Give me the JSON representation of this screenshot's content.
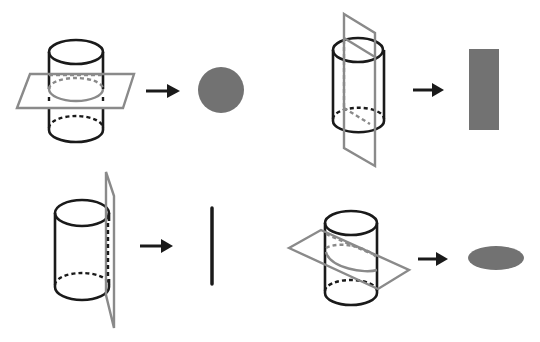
{
  "diagram": {
    "colors": {
      "cylinder_outline": "#1a1a1a",
      "plane": "#8a8a8a",
      "section_fill": "#727272",
      "background": "#ffffff"
    },
    "panels": [
      {
        "id": "horizontal-cut",
        "plane": "horizontal, parallel to base",
        "arrow": "right-arrow",
        "result_shape": "circle"
      },
      {
        "id": "vertical-axial-cut",
        "plane": "vertical, through axis",
        "arrow": "right-arrow",
        "result_shape": "rectangle"
      },
      {
        "id": "tangent-cut",
        "plane": "vertical, tangent to side",
        "arrow": "right-arrow",
        "result_shape": "line-segment"
      },
      {
        "id": "oblique-cut",
        "plane": "oblique, not through bases",
        "arrow": "right-arrow",
        "result_shape": "ellipse"
      }
    ]
  }
}
